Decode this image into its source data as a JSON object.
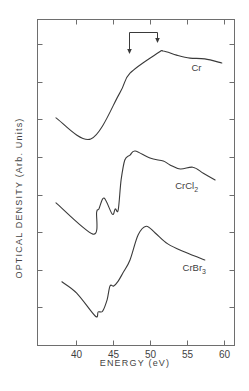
{
  "chart_data": {
    "type": "line",
    "title": "",
    "xlabel": "ENERGY (eV)",
    "ylabel": "OPTICAL DENSITY (Arb. Units)",
    "xlim": [
      34.7,
      61.5
    ],
    "ylim": [
      0,
      8.7
    ],
    "x_ticks": [
      40,
      45,
      50,
      55,
      60
    ],
    "x_tick_labels": [
      "40",
      "45",
      "50",
      "55",
      "60"
    ],
    "y_ticks": [
      1,
      2,
      3,
      4,
      5,
      6,
      7,
      8
    ],
    "y_tick_labels": [],
    "grid": false,
    "legend": "inline labels next to each curve",
    "annotations": [
      {
        "type": "bracket-arrows",
        "from_x": 47.0,
        "to_x": 50.8,
        "description": "bracket with two downward arrows marking energy positions near 47 eV and 51 eV"
      }
    ],
    "series": [
      {
        "name": "Cr",
        "label": "Cr",
        "label_sub": "",
        "label_pos": [
          55.6,
          7.3
        ],
        "x": [
          37.3,
          42.0,
          45.9,
          47.3,
          51.1,
          51.8,
          53.6,
          55.4,
          57.4,
          59.7
        ],
        "values": [
          6.04,
          5.48,
          6.7,
          7.23,
          7.77,
          7.82,
          7.71,
          7.63,
          7.61,
          7.5
        ]
      },
      {
        "name": "CrCl2",
        "label": "CrCl",
        "label_sub": "2",
        "label_pos": [
          53.4,
          4.16
        ],
        "x": [
          37.3,
          42.3,
          42.8,
          43.1,
          43.8,
          44.9,
          45.3,
          45.7,
          46.1,
          46.6,
          47.3,
          48.0,
          50.0,
          51.8,
          52.7,
          54.1,
          55.8,
          57.2,
          58.8
        ],
        "values": [
          3.78,
          2.95,
          3.54,
          3.62,
          3.91,
          3.48,
          3.62,
          3.59,
          4.39,
          4.92,
          5.05,
          5.16,
          4.97,
          4.89,
          4.79,
          4.68,
          4.73,
          4.57,
          4.39
        ]
      },
      {
        "name": "CrBr3",
        "label": "CrBr",
        "label_sub": "3",
        "label_pos": [
          54.4,
          1.96
        ],
        "x": [
          38.1,
          40.1,
          42.6,
          43.0,
          43.6,
          44.2,
          44.6,
          45.1,
          45.7,
          46.4,
          47.3,
          48.4,
          49.5,
          50.7,
          52.4,
          54.7,
          57.4
        ],
        "values": [
          1.68,
          1.38,
          0.77,
          0.88,
          0.9,
          1.2,
          1.57,
          1.57,
          1.7,
          1.94,
          2.26,
          2.93,
          3.16,
          2.98,
          2.69,
          2.47,
          2.26
        ]
      }
    ]
  }
}
